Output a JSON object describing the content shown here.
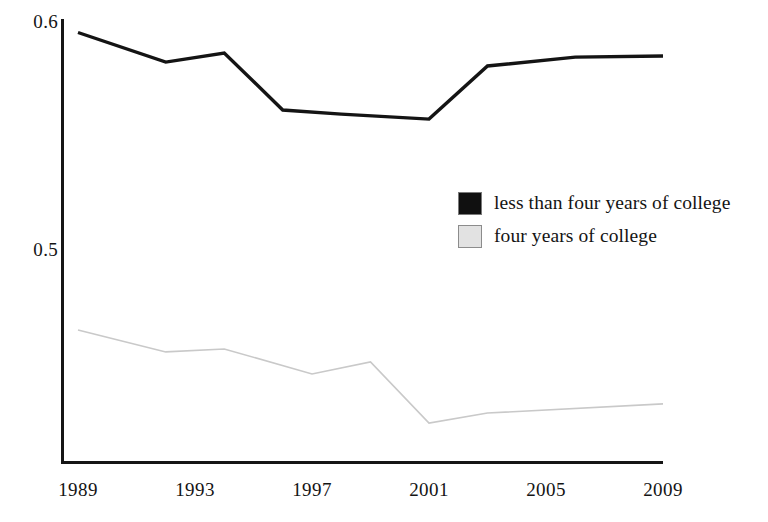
{
  "chart_data": {
    "type": "line",
    "title": "",
    "xlabel": "",
    "ylabel": "",
    "xlim": [
      1989,
      2009
    ],
    "ylim": [
      0.415,
      0.602
    ],
    "grid": false,
    "legend_position": "center-right",
    "y_ticks": [
      "0.6",
      "0.5"
    ],
    "y_tick_values": [
      0.6,
      0.5
    ],
    "x_ticks": [
      "1989",
      "1993",
      "1997",
      "2001",
      "2005",
      "2009"
    ],
    "x_tick_values": [
      1989,
      1993,
      1997,
      2001,
      2005,
      2009
    ],
    "series": [
      {
        "name": "less than four years of college",
        "color": "#141414",
        "style": "solid-thick",
        "x": [
          1989,
          1992,
          1994,
          1996,
          1998,
          2001,
          2003,
          2006,
          2009
        ],
        "values": [
          0.5954,
          0.5824,
          0.5864,
          0.5614,
          0.5596,
          0.5574,
          0.5807,
          0.5846,
          0.5851
        ]
      },
      {
        "name": "four years of college",
        "color": "#c9c9c9",
        "style": "solid-thin",
        "x": [
          1989,
          1992,
          1994,
          1997,
          1999,
          2001,
          2003,
          2009
        ],
        "values": [
          0.4649,
          0.4553,
          0.4566,
          0.4456,
          0.4509,
          0.4241,
          0.4285,
          0.4325
        ]
      }
    ]
  },
  "legend": {
    "items": [
      {
        "label": "less than four years of college",
        "swatch_fill": "#101010",
        "swatch_border": "#7a7a7a"
      },
      {
        "label": "four years of college",
        "swatch_fill": "#e2e2e2",
        "swatch_border": "#8c8c8c"
      }
    ]
  },
  "axes": {
    "axis_color": "#151515"
  }
}
